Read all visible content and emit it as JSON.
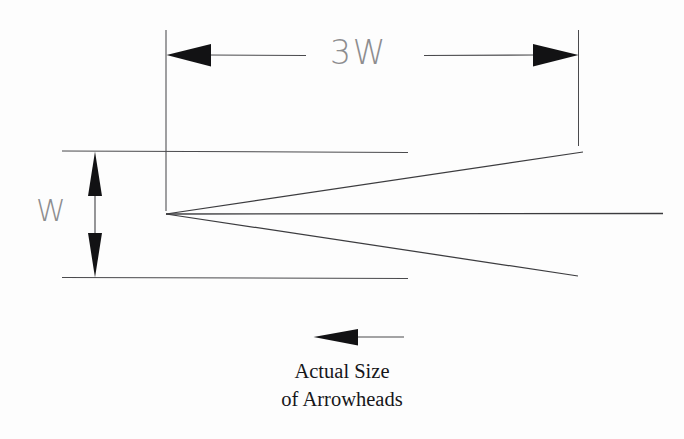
{
  "figure": {
    "background_color": "#fdfdfd",
    "line_color": "#3c3c3f",
    "fill_color": "#121214",
    "dimension_label_color": "#8d8d8f",
    "caption_color": "#16161a"
  },
  "dimensions": {
    "horizontal": {
      "label": "3W",
      "icon_left": "arrow-left-icon",
      "icon_right": "arrow-right-icon",
      "extension_line_left_x": 166,
      "extension_line_right_x": 578,
      "dimension_line_y": 55,
      "span_px": 412,
      "ratio_to_w": 3
    },
    "vertical": {
      "label": "W",
      "icon_top": "arrow-up-icon",
      "icon_bottom": "arrow-down-icon",
      "extension_line_top_y": 151,
      "extension_line_bottom_y": 277,
      "dimension_line_x": 95,
      "span_px": 126,
      "ratio_to_w": 1
    }
  },
  "arrowhead_outline": {
    "name": "large-arrowhead-outline",
    "tip_x": 166,
    "tip_y": 214,
    "upper_end_x": 583,
    "upper_end_y": 152,
    "lower_end_x": 578,
    "lower_end_y": 276,
    "shaft_end_x": 663,
    "shaft_y": 214
  },
  "actual_size": {
    "icon": "arrow-left-icon",
    "arrow_tip_x": 314,
    "arrow_tail_x": 358,
    "arrow_y": 337,
    "shaft_end_x": 404,
    "caption_line_1": "Actual Size",
    "caption_line_2": "of Arrowheads"
  }
}
